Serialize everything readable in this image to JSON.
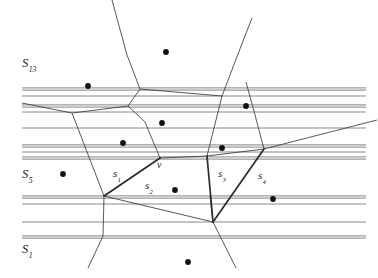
{
  "figure": {
    "kind": "voronoi-diagram-with-line-strips",
    "background_color": "#ffffff",
    "line_color": "#3a3a3a",
    "strip_color": "#6e6e6e",
    "site_color": "#111111",
    "width": 378,
    "height": 278
  },
  "labels": {
    "region_top": {
      "base": "S",
      "sub": "13",
      "x": 22,
      "y": 57
    },
    "region_middle": {
      "base": "S",
      "sub": "5",
      "x": 22,
      "y": 168
    },
    "region_bottom": {
      "base": "S",
      "sub": "1",
      "x": 22,
      "y": 243
    },
    "segment_1": {
      "base": "s",
      "sub": "1",
      "x": 113,
      "y": 168
    },
    "segment_2": {
      "base": "s",
      "sub": "2",
      "x": 145,
      "y": 180
    },
    "segment_3": {
      "base": "s",
      "sub": "3",
      "x": 218,
      "y": 168
    },
    "segment_4": {
      "base": "s",
      "sub": "4",
      "x": 258,
      "y": 170
    },
    "vertex": {
      "base": "v",
      "sub": "",
      "x": 157,
      "y": 160
    }
  },
  "chart_data": {
    "type": "scatter",
    "title": "",
    "xlabel": "",
    "ylabel": "",
    "xlim": [
      0,
      378
    ],
    "ylim": [
      0,
      278
    ],
    "grid": false,
    "legend": "none",
    "sites": [
      {
        "id": "p1",
        "x": 166,
        "y": 52
      },
      {
        "id": "p2",
        "x": 88,
        "y": 86
      },
      {
        "id": "p3",
        "x": 246,
        "y": 106
      },
      {
        "id": "p4",
        "x": 162,
        "y": 123
      },
      {
        "id": "p5",
        "x": 123,
        "y": 143
      },
      {
        "id": "p6",
        "x": 222,
        "y": 148
      },
      {
        "id": "p7",
        "x": 63,
        "y": 174
      },
      {
        "id": "p8",
        "x": 175,
        "y": 190
      },
      {
        "id": "p9",
        "x": 273,
        "y": 199
      },
      {
        "id": "p10",
        "x": 188,
        "y": 262
      }
    ],
    "strips": [
      {
        "id": "strip-1",
        "y": 89,
        "weight": "double"
      },
      {
        "id": "strip-2",
        "y": 96,
        "weight": "single"
      },
      {
        "id": "strip-3",
        "y": 106,
        "weight": "double"
      },
      {
        "id": "strip-4",
        "y": 112,
        "weight": "single"
      },
      {
        "id": "strip-5",
        "y": 128,
        "weight": "single"
      },
      {
        "id": "strip-6",
        "y": 146,
        "weight": "double"
      },
      {
        "id": "strip-7",
        "y": 152,
        "weight": "single"
      },
      {
        "id": "strip-8",
        "y": 158,
        "weight": "double"
      },
      {
        "id": "strip-9",
        "y": 197,
        "weight": "double"
      },
      {
        "id": "strip-10",
        "y": 204,
        "weight": "single"
      },
      {
        "id": "strip-11",
        "y": 222,
        "weight": "single"
      },
      {
        "id": "strip-12",
        "y": 237,
        "weight": "double"
      }
    ],
    "voronoi_edges": [
      {
        "id": "e1",
        "points": "112,0 127,55 140,89"
      },
      {
        "id": "e2",
        "points": "140,89 222,96"
      },
      {
        "id": "e3",
        "points": "222,96 243,41 252,18"
      },
      {
        "id": "e4",
        "points": "140,89 128,106"
      },
      {
        "id": "e5",
        "points": "128,106 145,122 160,158"
      },
      {
        "id": "e6",
        "points": "128,106 72,113"
      },
      {
        "id": "e7",
        "points": "72,113 22,103"
      },
      {
        "id": "e8",
        "points": "72,113 104,196"
      },
      {
        "id": "e9",
        "points": "222,96 214,128 207,156"
      },
      {
        "id": "e10",
        "points": "207,156 160,158"
      },
      {
        "id": "e11",
        "points": "207,156 264,149"
      },
      {
        "id": "e12",
        "points": "264,149 377,120"
      },
      {
        "id": "e13",
        "points": "264,149 255,115 246,82"
      },
      {
        "id": "e14",
        "points": "104,196 103,236 88,268"
      },
      {
        "id": "e15",
        "points": "104,196 213,222"
      },
      {
        "id": "e16",
        "points": "213,222 210,196"
      },
      {
        "id": "e17",
        "points": "213,222 236,268"
      }
    ],
    "highlighted_chain": [
      {
        "id": "s1",
        "points": "104,196 160,158",
        "label": "s1"
      },
      {
        "id": "s2",
        "points": "160,158 160,158",
        "label": "s2"
      },
      {
        "id": "s3",
        "points": "207,156 213,222",
        "label": "s3"
      },
      {
        "id": "s4",
        "points": "213,222 264,149",
        "label": "s4"
      }
    ]
  }
}
